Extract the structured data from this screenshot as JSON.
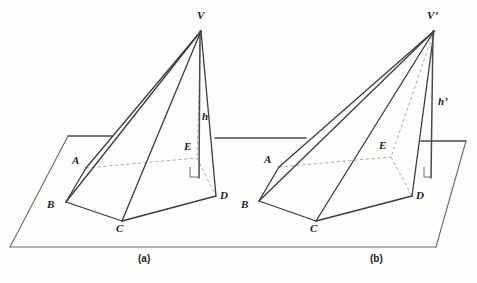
{
  "figure": {
    "stroke_color": "#3b3b3b",
    "dashed_color": "#9a9a9a",
    "plane_color": "#4a4a4a",
    "background": "#fdfdfc"
  },
  "captions": [
    {
      "id": "caption-a",
      "text": "(a)",
      "x": 138,
      "y": 255
    },
    {
      "id": "caption-b",
      "text": "(b)",
      "x": 370,
      "y": 255
    }
  ],
  "panels": [
    {
      "id": "panel-a",
      "caption": "(a)",
      "apex_label": "V",
      "height_label": "h",
      "vertices": {
        "V": {
          "x": 201,
          "y": 31
        },
        "A": {
          "x": 86,
          "y": 168
        },
        "B": {
          "x": 66,
          "y": 202
        },
        "C": {
          "x": 122,
          "y": 221
        },
        "D": {
          "x": 216,
          "y": 196
        },
        "E": {
          "x": 197,
          "y": 158
        },
        "F": {
          "x": 199,
          "y": 176
        }
      },
      "labels": [
        {
          "name": "vertex-label-V",
          "text": "V",
          "x": 197,
          "y": 16
        },
        {
          "name": "vertex-label-A",
          "text": "A",
          "x": 73,
          "y": 160
        },
        {
          "name": "vertex-label-B",
          "text": "B",
          "x": 49,
          "y": 203
        },
        {
          "name": "vertex-label-C",
          "text": "C",
          "x": 118,
          "y": 226
        },
        {
          "name": "vertex-label-D",
          "text": "D",
          "x": 221,
          "y": 194
        },
        {
          "name": "vertex-label-E",
          "text": "E",
          "x": 185,
          "y": 144
        },
        {
          "name": "height-label-h",
          "text": "h",
          "x": 203,
          "y": 115
        }
      ]
    },
    {
      "id": "panel-b",
      "caption": "(b)",
      "apex_label": "V’",
      "height_label": "h’",
      "vertices": {
        "V": {
          "x": 434,
          "y": 31
        },
        "A": {
          "x": 279,
          "y": 167
        },
        "B": {
          "x": 259,
          "y": 201
        },
        "C": {
          "x": 316,
          "y": 221
        },
        "D": {
          "x": 412,
          "y": 196
        },
        "E": {
          "x": 391,
          "y": 157
        },
        "F": {
          "x": 434,
          "y": 176
        }
      },
      "labels": [
        {
          "name": "vertex-label-V-prime",
          "text": "V’",
          "x": 428,
          "y": 16
        },
        {
          "name": "vertex-label-A",
          "text": "A",
          "x": 265,
          "y": 159
        },
        {
          "name": "vertex-label-B",
          "text": "B",
          "x": 243,
          "y": 203
        },
        {
          "name": "vertex-label-C",
          "text": "C",
          "x": 311,
          "y": 226
        },
        {
          "name": "vertex-label-D",
          "text": "D",
          "x": 417,
          "y": 194
        },
        {
          "name": "vertex-label-E",
          "text": "E",
          "x": 380,
          "y": 143
        },
        {
          "name": "height-label-h-prime",
          "text": "h’",
          "x": 440,
          "y": 100
        }
      ]
    }
  ],
  "plane": {
    "name": "base-plane",
    "left_section": {
      "top_left": {
        "x": 68,
        "y": 136
      },
      "top_right": {
        "x": 305,
        "y": 138
      },
      "bottom_left": {
        "x": 10,
        "y": 247
      },
      "bottom_right": {
        "x": 436,
        "y": 247
      }
    },
    "right_section": {
      "top_left": {
        "x": 420,
        "y": 141
      },
      "top_right": {
        "x": 466,
        "y": 142
      },
      "bottom_right": {
        "x": 436,
        "y": 247
      }
    }
  }
}
